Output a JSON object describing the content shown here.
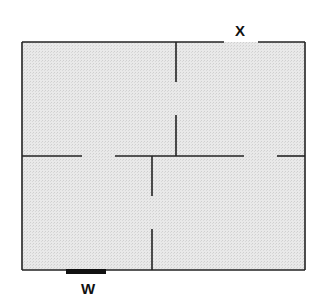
{
  "diagram": {
    "type": "floor-plan",
    "rooms": 4,
    "labels": {
      "x": "X",
      "w": "W"
    },
    "colors": {
      "floor_fill": "#e6e6e6",
      "wall": "#222222",
      "window": "#111111"
    },
    "features": [
      {
        "id": "X",
        "kind": "door-opening",
        "location": "top wall, right room"
      },
      {
        "id": "W",
        "kind": "window",
        "location": "bottom wall, left room"
      }
    ]
  }
}
